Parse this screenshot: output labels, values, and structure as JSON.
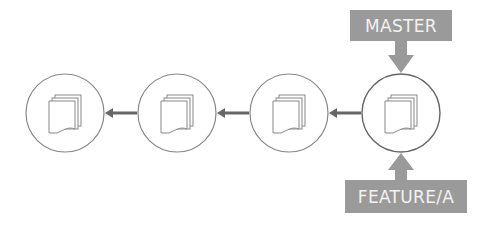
{
  "diagram": {
    "type": "git-branch-commits",
    "commits": [
      {
        "id": "commit-1",
        "icon": "document-stack-icon"
      },
      {
        "id": "commit-2",
        "icon": "document-stack-icon"
      },
      {
        "id": "commit-3",
        "icon": "document-stack-icon"
      },
      {
        "id": "commit-4",
        "icon": "document-stack-icon"
      }
    ],
    "edges": [
      {
        "from": "commit-2",
        "to": "commit-1"
      },
      {
        "from": "commit-3",
        "to": "commit-2"
      },
      {
        "from": "commit-4",
        "to": "commit-3"
      }
    ],
    "labels": {
      "master": "MASTER",
      "feature": "FEATURE/A"
    },
    "colors": {
      "label_bg": "#9a9a9a",
      "label_text": "#f2f2f2",
      "line": "#555555",
      "circle": "#777777"
    }
  }
}
